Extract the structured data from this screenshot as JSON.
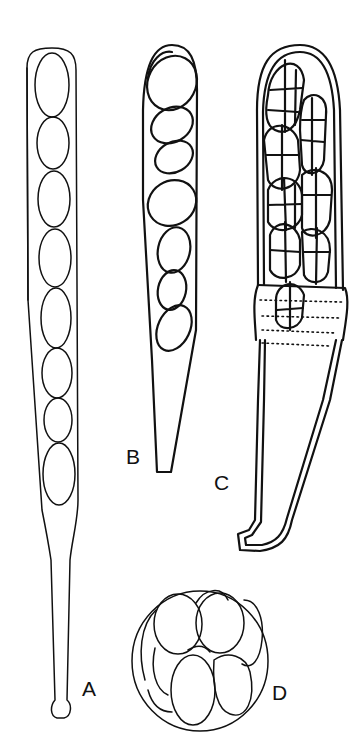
{
  "figure": {
    "labels": {
      "a": "A",
      "b": "B",
      "c": "C",
      "d": "D"
    },
    "line_color": "#111111",
    "background": "#ffffff"
  }
}
